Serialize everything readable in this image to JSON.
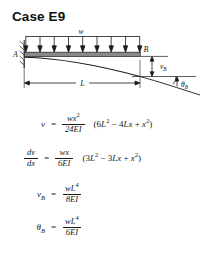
{
  "title": "Case E9",
  "diagram": {
    "load_label": "w",
    "support_label_left": "A",
    "node_label_right": "B",
    "deflection_label": "v",
    "deflection_label_sub": "B",
    "angle_label": "θ",
    "angle_label_sub": "B",
    "span_label": "L",
    "load_arrow_count": 9,
    "stroke_color": "#1a1a1a",
    "beam_fill": "#8a8a8a"
  },
  "equations": [
    {
      "lhs": "v",
      "lhs_sub": "",
      "eq": "=",
      "num_prefix": "wx",
      "num_sup": "2",
      "den": "24EI",
      "tail_open": "(6",
      "tail": "L",
      "tail_sup": "2",
      "tail_mid": " − 4",
      "tail_var2": "Lx",
      "tail_plus": " + ",
      "tail_var3": "x",
      "tail_sup3": "2",
      "tail_close": ")"
    },
    {
      "lhs": "dv",
      "lhs_den": "dx",
      "eq": "=",
      "num_prefix": "wx",
      "num_sup": "",
      "den": "6EI",
      "tail_open": "(3",
      "tail": "L",
      "tail_sup": "2",
      "tail_mid": " − 3",
      "tail_var2": "Lx",
      "tail_plus": " + ",
      "tail_var3": "x",
      "tail_sup3": "2",
      "tail_close": ")"
    },
    {
      "lhs": "v",
      "lhs_sub": "B",
      "eq": "=",
      "num_prefix": "wL",
      "num_sup": "4",
      "den": "8EI",
      "tail_open": "",
      "tail": "",
      "tail_sup": "",
      "tail_mid": "",
      "tail_var2": "",
      "tail_plus": "",
      "tail_var3": "",
      "tail_sup3": "",
      "tail_close": ""
    },
    {
      "lhs": "θ",
      "lhs_sub": "B",
      "eq": "=",
      "num_prefix": "wL",
      "num_sup": "4",
      "den": "6EI",
      "tail_open": "",
      "tail": "",
      "tail_sup": "",
      "tail_mid": "",
      "tail_var2": "",
      "tail_plus": "",
      "tail_var3": "",
      "tail_sup3": "",
      "tail_close": ""
    }
  ]
}
